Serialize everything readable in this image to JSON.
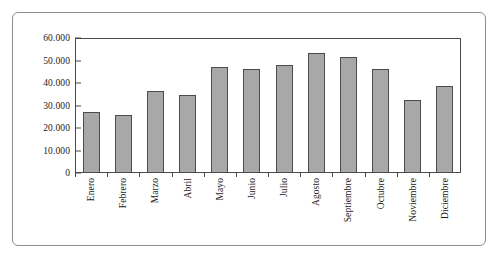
{
  "chart_data": {
    "type": "bar",
    "title": "",
    "xlabel": "",
    "ylabel": "",
    "ylim": [
      0,
      60000
    ],
    "grid": false,
    "legend": "none",
    "categories": [
      "Enero",
      "Febrero",
      "Marzo",
      "Abril",
      "Mayo",
      "Junio",
      "Julio",
      "Agosto",
      "Septiembre",
      "Octubre",
      "Noviembre",
      "Diciembre"
    ],
    "values": [
      27300,
      26000,
      36500,
      34800,
      47300,
      46400,
      48200,
      53300,
      51500,
      46300,
      32300,
      38600
    ],
    "ytick_values": [
      60000,
      50000,
      40000,
      30000,
      20000,
      10000,
      0
    ],
    "ytick_labels": [
      "60.000",
      "50.000",
      "40.000",
      "30.000",
      "20.000",
      "10.000",
      "0"
    ],
    "series": [
      {
        "name": "",
        "values": [
          27300,
          26000,
          36500,
          34800,
          47300,
          46400,
          48200,
          53300,
          51500,
          46300,
          32300,
          38600
        ]
      }
    ]
  },
  "style": {
    "bar_fill": "#a8a8a8",
    "bar_stroke": "#4b4b4b",
    "axis_color": "#4a4a4a",
    "frame_color": "#8d8d8d",
    "text_color": "#1a1a1a",
    "background": "#ffffff"
  }
}
